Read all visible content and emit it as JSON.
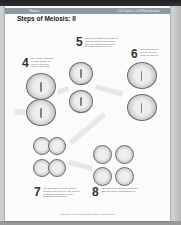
{
  "header": {
    "left_label": "Meiosis",
    "right_label": "Cell Cycles / Cell Reproduction",
    "title": "Steps of Meiosis: II"
  },
  "steps": [
    {
      "number": "4",
      "text": "The nuclear membrane re-forms and the cell divides. The nuclei return to interphase."
    },
    {
      "number": "5",
      "text": "Each cell contains one member of each homologous chromosome pair. The chromosomes line up along the equator of the cell."
    },
    {
      "number": "6",
      "text": "The chromosomes then line up in the middle of each cell."
    },
    {
      "number": "7",
      "text": "The chromatids are pulled apart to opposite ends of the cell. The nuclear membranes re-form around the separated chromosomes."
    },
    {
      "number": "8",
      "text": "The result is four haploid cells that are different from the original single cell."
    }
  ],
  "footer": {
    "copyright": "Copyright © by Holt, Rinehart and Winston. All rights reserved."
  },
  "colors": {
    "band": "#8a9aa0",
    "page": "#fbfbfb",
    "background": "#3a3a3a"
  }
}
